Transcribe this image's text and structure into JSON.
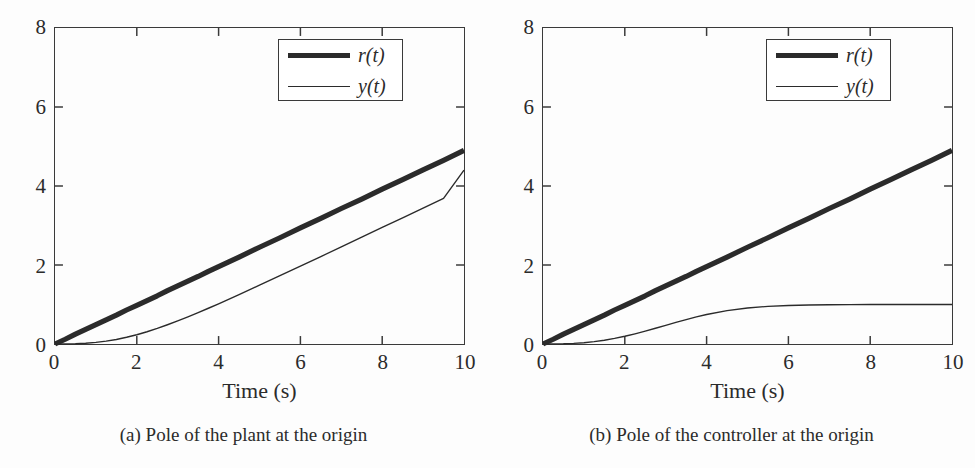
{
  "figure": {
    "background_color": "#fdfdfd",
    "line_color": "#2b2b2b"
  },
  "panels": [
    {
      "id": "panel-a",
      "caption": "(a) Pole of the plant at the origin",
      "axis_label_x": "Time (s)",
      "legend": {
        "position": "top-right",
        "entries": [
          {
            "label": "r(t)",
            "style": "thick"
          },
          {
            "label": "y(t)",
            "style": "thin"
          }
        ]
      },
      "xticks": [
        "0",
        "2",
        "4",
        "6",
        "8",
        "10"
      ],
      "yticks": [
        "0",
        "2",
        "4",
        "6",
        "8"
      ]
    },
    {
      "id": "panel-b",
      "caption": "(b) Pole of the controller at the origin",
      "axis_label_x": "Time (s)",
      "legend": {
        "position": "top-right",
        "entries": [
          {
            "label": "r(t)",
            "style": "thick"
          },
          {
            "label": "y(t)",
            "style": "thin"
          }
        ]
      },
      "xticks": [
        "0",
        "2",
        "4",
        "6",
        "8",
        "10"
      ],
      "yticks": [
        "0",
        "2",
        "4",
        "6",
        "8"
      ]
    }
  ],
  "chart_data": [
    {
      "type": "line",
      "title": "(a) Pole of the plant at the origin",
      "xlabel": "Time (s)",
      "ylabel": "",
      "xlim": [
        0,
        10
      ],
      "ylim": [
        0,
        8
      ],
      "xticks": [
        0,
        2,
        4,
        6,
        8,
        10
      ],
      "yticks": [
        0,
        2,
        4,
        6,
        8
      ],
      "grid": false,
      "legend_position": "top-right",
      "x": [
        0,
        0.25,
        0.5,
        0.75,
        1,
        1.25,
        1.5,
        1.75,
        2,
        2.25,
        2.5,
        2.75,
        3,
        3.25,
        3.5,
        3.75,
        4,
        4.5,
        5,
        5.5,
        6,
        6.5,
        7,
        7.5,
        8,
        8.5,
        9,
        9.5,
        10
      ],
      "series": [
        {
          "name": "r(t)",
          "style": "thick",
          "values": [
            0,
            0.12,
            0.25,
            0.37,
            0.49,
            0.61,
            0.73,
            0.86,
            0.98,
            1.1,
            1.22,
            1.35,
            1.47,
            1.59,
            1.71,
            1.84,
            1.96,
            2.2,
            2.45,
            2.69,
            2.94,
            3.18,
            3.43,
            3.67,
            3.92,
            4.16,
            4.41,
            4.65,
            4.9
          ]
        },
        {
          "name": "y(t)",
          "style": "thin",
          "values": [
            0,
            0.001,
            0.006,
            0.018,
            0.04,
            0.072,
            0.115,
            0.17,
            0.235,
            0.31,
            0.395,
            0.487,
            0.585,
            0.688,
            0.795,
            0.905,
            1.018,
            1.25,
            1.49,
            1.73,
            1.97,
            2.215,
            2.46,
            2.705,
            2.95,
            3.195,
            3.44,
            3.685,
            4.4
          ]
        }
      ]
    },
    {
      "type": "line",
      "title": "(b) Pole of the controller at the origin",
      "xlabel": "Time (s)",
      "ylabel": "",
      "xlim": [
        0,
        10
      ],
      "ylim": [
        0,
        8
      ],
      "xticks": [
        0,
        2,
        4,
        6,
        8,
        10
      ],
      "yticks": [
        0,
        2,
        4,
        6,
        8
      ],
      "grid": false,
      "legend_position": "top-right",
      "x": [
        0,
        0.25,
        0.5,
        0.75,
        1,
        1.25,
        1.5,
        1.75,
        2,
        2.25,
        2.5,
        2.75,
        3,
        3.25,
        3.5,
        3.75,
        4,
        4.5,
        5,
        5.5,
        6,
        6.5,
        7,
        7.5,
        8,
        8.5,
        9,
        9.5,
        10
      ],
      "series": [
        {
          "name": "r(t)",
          "style": "thick",
          "values": [
            0,
            0.12,
            0.25,
            0.37,
            0.49,
            0.61,
            0.73,
            0.86,
            0.98,
            1.1,
            1.22,
            1.35,
            1.47,
            1.59,
            1.71,
            1.84,
            1.96,
            2.2,
            2.45,
            2.69,
            2.94,
            3.18,
            3.43,
            3.67,
            3.92,
            4.16,
            4.41,
            4.65,
            4.9
          ]
        },
        {
          "name": "y(t)",
          "style": "thin",
          "values": [
            0,
            0.001,
            0.005,
            0.015,
            0.033,
            0.06,
            0.096,
            0.142,
            0.196,
            0.258,
            0.326,
            0.398,
            0.472,
            0.546,
            0.618,
            0.685,
            0.746,
            0.845,
            0.912,
            0.953,
            0.976,
            0.988,
            0.994,
            0.997,
            0.999,
            1.0,
            1.0,
            1.0,
            1.0
          ]
        }
      ]
    }
  ]
}
